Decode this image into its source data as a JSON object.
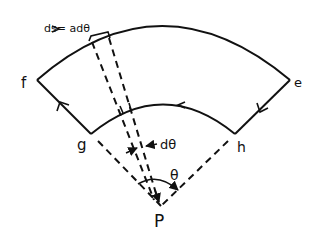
{
  "diagram": {
    "type": "sector loop around point P",
    "labels": {
      "ds": "ds= adθ",
      "f": "f",
      "e": "e",
      "g": "g",
      "h": "h",
      "dtheta": "dθ",
      "theta": "θ",
      "P": "P"
    },
    "colors": {
      "ink": "#111111",
      "background": "#ffffff"
    },
    "path_direction": "f → e (outer arc), e → h, h → g (inner arc), g → f"
  }
}
